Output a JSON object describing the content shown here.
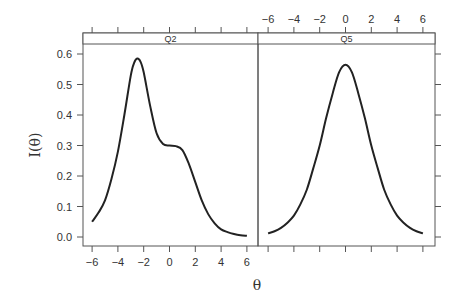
{
  "chart_data": {
    "type": "line",
    "title": "",
    "xlabel": "θ",
    "ylabel": "I(θ)",
    "xlim": [
      -6.7,
      6.9
    ],
    "ylim": [
      -0.03,
      0.63
    ],
    "x_ticks": [
      -6,
      -4,
      -2,
      0,
      2,
      4,
      6
    ],
    "y_ticks": [
      0.0,
      0.1,
      0.2,
      0.3,
      0.4,
      0.5,
      0.6
    ],
    "y_tick_labels": [
      "0.0",
      "0.1",
      "0.2",
      "0.3",
      "0.4",
      "0.5",
      "0.6"
    ],
    "grid": false,
    "legend": null,
    "panels": [
      {
        "strip": "Q2",
        "x": [
          -6,
          -5.5,
          -5,
          -4.5,
          -4,
          -3.5,
          -3,
          -2.75,
          -2.5,
          -2.25,
          -2,
          -1.5,
          -1,
          -0.5,
          0,
          0.5,
          1,
          1.5,
          2,
          2.5,
          3,
          3.5,
          4,
          4.5,
          5,
          5.5,
          6
        ],
        "y": [
          0.05,
          0.08,
          0.12,
          0.19,
          0.28,
          0.4,
          0.53,
          0.57,
          0.585,
          0.575,
          0.54,
          0.43,
          0.34,
          0.305,
          0.3,
          0.298,
          0.285,
          0.24,
          0.18,
          0.12,
          0.075,
          0.045,
          0.025,
          0.016,
          0.01,
          0.006,
          0.004
        ]
      },
      {
        "strip": "Q5",
        "x": [
          -6,
          -5.5,
          -5,
          -4.5,
          -4,
          -3.5,
          -3,
          -2.5,
          -2,
          -1.5,
          -1,
          -0.5,
          0,
          0.5,
          1,
          1.5,
          2,
          2.5,
          3,
          3.5,
          4,
          4.5,
          5,
          5.5,
          6
        ],
        "y": [
          0.012,
          0.019,
          0.03,
          0.047,
          0.07,
          0.107,
          0.155,
          0.225,
          0.3,
          0.39,
          0.47,
          0.54,
          0.565,
          0.54,
          0.47,
          0.39,
          0.3,
          0.225,
          0.155,
          0.107,
          0.07,
          0.047,
          0.03,
          0.019,
          0.012
        ]
      }
    ],
    "layout": {
      "panels_side_by_side": true,
      "bottom_axis_labels_on_panel": 0,
      "top_axis_labels_on_panel": 1,
      "left_axis_labels": true,
      "right_axis_ticks_only": true
    }
  },
  "colors": {
    "line": "#222222",
    "frame": "#555555",
    "strip_bg": "#ffffff",
    "text": "#333333"
  }
}
